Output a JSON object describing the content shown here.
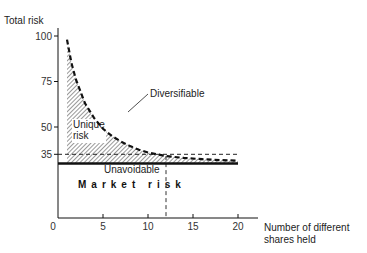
{
  "chart_data": {
    "type": "area",
    "title": "",
    "ylabel": "Total risk",
    "xlabel": "Number of different shares held",
    "xlabel_lines": [
      "Number of different",
      "shares held"
    ],
    "xlim": [
      0,
      20
    ],
    "ylim": [
      0,
      100
    ],
    "x_ticks": [
      0,
      5,
      10,
      15,
      20
    ],
    "x_tick_labels": [
      "0",
      "5",
      "10",
      "15",
      "20"
    ],
    "y_ticks": [
      100,
      75,
      50,
      35
    ],
    "y_tick_labels": [
      "100",
      "75",
      "50",
      "35"
    ],
    "grid": false,
    "market_risk_level": 30,
    "dashed_reference_level": 35,
    "dashed_reference_x": 12,
    "series": [
      {
        "name": "Total risk",
        "style": "dashed",
        "x": [
          1,
          1.5,
          2,
          3,
          4,
          5,
          6,
          7,
          8,
          9,
          10,
          12,
          14,
          16,
          18,
          20
        ],
        "values": [
          98,
          85,
          76,
          63,
          55,
          49,
          45,
          42,
          39.5,
          37.5,
          36,
          34,
          33,
          32.3,
          31.8,
          31.5
        ]
      },
      {
        "name": "Market risk",
        "style": "solid",
        "x": [
          0,
          20
        ],
        "values": [
          30,
          30
        ]
      }
    ],
    "annotations": {
      "diversifiable": "Diversifiable",
      "unique_line1": "Unique",
      "unique_line2": "risk",
      "unavoidable": "Unavoidable",
      "market_risk": "Market  risk"
    }
  }
}
